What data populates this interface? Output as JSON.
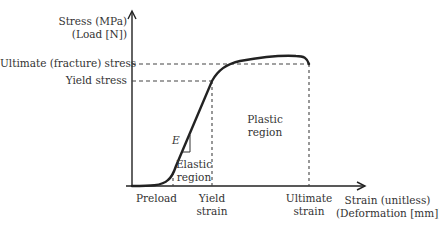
{
  "diagram": {
    "y_axis": {
      "label_line1": "Stress (MPa)",
      "label_line2": "(Load [N])"
    },
    "x_axis": {
      "label_line1": "Strain (unitless)",
      "label_line2": "(Deformation [mm])"
    },
    "y_markers": {
      "ultimate": "Ultimate (fracture) stress",
      "yield": "Yield stress"
    },
    "x_markers": {
      "preload": "Preload",
      "yield_line1": "Yield",
      "yield_line2": "strain",
      "ultimate_line1": "Ultimate",
      "ultimate_line2": "strain"
    },
    "regions": {
      "elastic_line1": "Elastic",
      "elastic_line2": "region",
      "plastic_line1": "Plastic",
      "plastic_line2": "region"
    },
    "modulus_symbol": "E",
    "colors": {
      "curve": "#222222",
      "axis": "#222222",
      "dashed": "#444444"
    }
  }
}
